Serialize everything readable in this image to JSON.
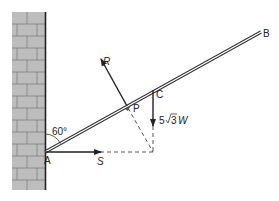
{
  "diagram": {
    "type": "statics-rod-against-wall",
    "labels": {
      "A": "A",
      "B": "B",
      "C": "C",
      "P": "P",
      "R": "R",
      "S": "S",
      "angle": "60°",
      "weight_coeff": "5",
      "weight_sqrt": "3",
      "weight_var": "W"
    },
    "elements": {
      "wall": "brick wall",
      "rod": "rod AB",
      "forces": [
        "R (normal reaction at P)",
        "S (horizontal force at A)",
        "5√3W (weight at C)"
      ]
    },
    "colors": {
      "wall_fill": "#bdbdbd",
      "wall_mortar": "#7a7a7a",
      "wall_edge": "#222222",
      "ink": "#222222"
    }
  }
}
